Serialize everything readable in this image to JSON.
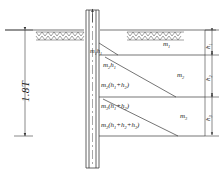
{
  "figure": {
    "type": "geotechnical-pile-soil-pressure-diagram"
  },
  "dimensions": {
    "overall_depth": {
      "label": "1.8T",
      "name": "overall-embedment-depth"
    },
    "layers": [
      {
        "label": "h",
        "sub": "1",
        "name": "layer-1-thickness"
      },
      {
        "label": "h",
        "sub": "2",
        "name": "layer-2-thickness"
      },
      {
        "label": "h",
        "sub": "3",
        "name": "layer-3-thickness"
      }
    ]
  },
  "soil_layers": [
    {
      "id": "layer-1",
      "modulus_label": "m",
      "modulus_sub": "1",
      "top_y": 30,
      "bottom_y": 55
    },
    {
      "id": "layer-2",
      "modulus_label": "m",
      "modulus_sub": "2",
      "top_y": 55,
      "bottom_y": 97
    },
    {
      "id": "layer-3",
      "modulus_label": "m",
      "modulus_sub": "3",
      "top_y": 97,
      "bottom_y": 136
    }
  ],
  "pressure_labels": [
    {
      "id": "p1",
      "text": "m",
      "sub1": "1",
      "tail": "h",
      "sub2": "1",
      "full": "m1h1"
    },
    {
      "id": "p2",
      "text": "m",
      "sub1": "2",
      "tail": "h",
      "sub2": "1",
      "full": "m2h1"
    },
    {
      "id": "p3",
      "text": "m",
      "sub1": "2",
      "tail": "(h",
      "sub2": "1",
      "tail2": "+h",
      "sub3": "2",
      "tail3": ")",
      "full": "m2(h1+h2)"
    },
    {
      "id": "p4",
      "text": "m",
      "sub1": "3",
      "tail": "(h",
      "sub2": "1",
      "tail2": "+h",
      "sub3": "2",
      "tail3": ")",
      "full": "m3(h1+h2)"
    },
    {
      "id": "p5",
      "text": "m",
      "sub1": "3",
      "tail": "(h",
      "sub2": "1",
      "tail2": "+h",
      "sub3": "2",
      "tail3": "+h",
      "sub4": "3",
      "tail4": ")",
      "full": "m3(h1+h2+h3)"
    }
  ],
  "ground": {
    "surface_label": "ground-surface-hatching",
    "y": 30
  },
  "colors": {
    "line": "#3a3a3a",
    "text": "#1a1a1a",
    "background": "#ffffff",
    "hatch": "#555555"
  }
}
